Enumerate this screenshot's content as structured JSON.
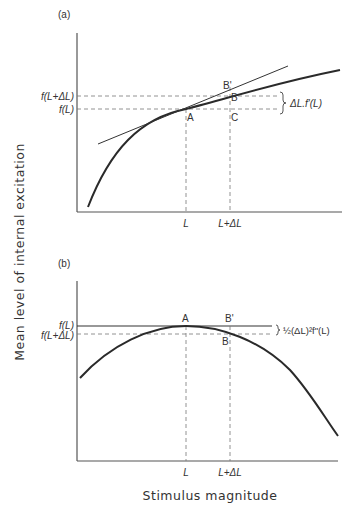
{
  "figure": {
    "y_axis_label": "Mean level of internal excitation",
    "x_axis_label": "Stimulus magnitude",
    "colors": {
      "ink": "#2a2a2a",
      "axis": "#555555",
      "dash": "#777777"
    }
  },
  "panel_a": {
    "label": "(a)",
    "y_ticks": [
      "f(L+ΔL)",
      "f(L)"
    ],
    "x_ticks": [
      "L",
      "L+ΔL"
    ],
    "points": {
      "A": "A",
      "B": "B",
      "B_prime": "B'",
      "C": "C"
    },
    "bracket_label": "ΔL.f'(L)",
    "curve": "concave (increasing, decelerating) with tangent at A"
  },
  "panel_b": {
    "label": "(b)",
    "y_ticks": [
      "f(L)",
      "f(L+ΔL)"
    ],
    "x_ticks": [
      "L",
      "L+ΔL"
    ],
    "points": {
      "A": "A",
      "B": "B",
      "B_prime": "B'"
    },
    "bracket_label": "½(ΔL)²f\"(L)",
    "curve": "peaked curve with horizontal tangent at A"
  }
}
